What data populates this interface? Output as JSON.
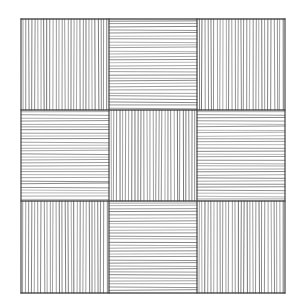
{
  "artwork": {
    "type": "hatched-grid",
    "background": "#ffffff",
    "ink": "#3a3a3a",
    "border": {
      "left": 21,
      "top": 19,
      "right": 285,
      "bottom": 293
    },
    "col_edges": [
      21,
      109,
      197,
      285
    ],
    "row_edges": [
      19,
      110,
      201,
      293
    ],
    "spacing": 3,
    "cells": [
      [
        "vertical",
        "horizontal",
        "vertical"
      ],
      [
        "horizontal",
        "vertical",
        "horizontal"
      ],
      [
        "vertical",
        "horizontal",
        "vertical"
      ]
    ]
  }
}
